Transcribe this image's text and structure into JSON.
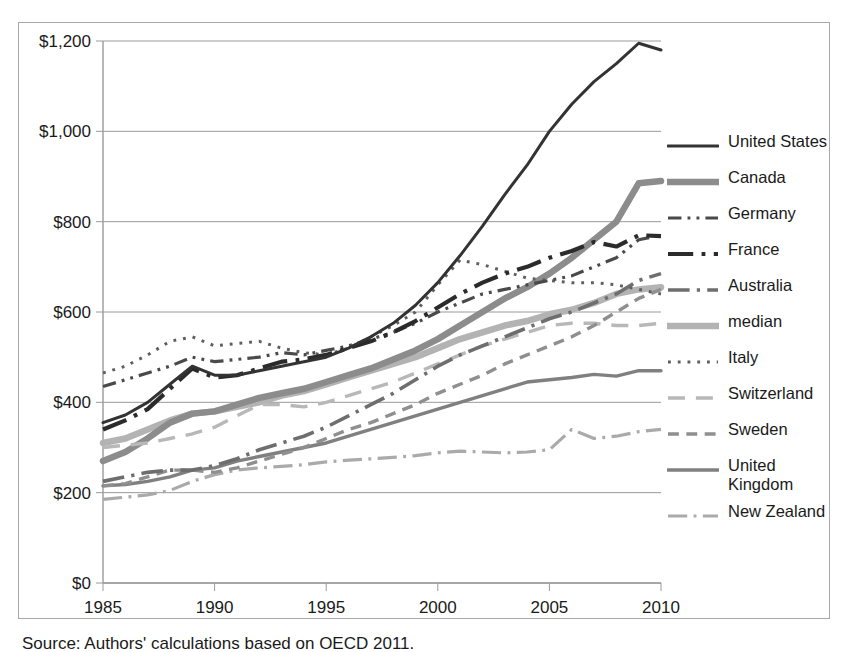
{
  "caption": "Source: Authors' calculations based on OECD 2011.",
  "legend": {
    "title": "",
    "items": [
      {
        "label": "United States",
        "color": "#333333",
        "width": 3.0,
        "dash": "none",
        "name": "legend-item-united-states"
      },
      {
        "label": "Canada",
        "color": "#8c8c8c",
        "width": 6.5,
        "dash": "none",
        "name": "legend-item-canada"
      },
      {
        "label": "Germany",
        "color": "#4a4a4a",
        "width": 3.2,
        "dash": "dashdotdot",
        "name": "legend-item-germany"
      },
      {
        "label": "France",
        "color": "#2b2b2b",
        "width": 4.2,
        "dash": "dashdot",
        "name": "legend-item-france"
      },
      {
        "label": "Australia",
        "color": "#6e6e6e",
        "width": 3.6,
        "dash": "dashdot",
        "name": "legend-item-australia"
      },
      {
        "label": "median",
        "color": "#b3b3b3",
        "width": 6.5,
        "dash": "none",
        "name": "legend-item-median"
      },
      {
        "label": "Italy",
        "color": "#5f5f5f",
        "width": 3.0,
        "dash": "dotted",
        "name": "legend-item-italy"
      },
      {
        "label": "Switzerland",
        "color": "#b8b8b8",
        "width": 3.4,
        "dash": "longdash",
        "name": "legend-item-switzerland"
      },
      {
        "label": "Sweden",
        "color": "#8f8f8f",
        "width": 3.4,
        "dash": "dashed",
        "name": "legend-item-sweden"
      },
      {
        "label": "United\nKingdom",
        "color": "#808080",
        "width": 3.4,
        "dash": "none",
        "name": "legend-item-united-kingdom"
      },
      {
        "label": "New Zealand",
        "color": "#aaaaaa",
        "width": 3.2,
        "dash": "dashdot",
        "name": "legend-item-new-zealand"
      }
    ]
  },
  "chart_data": {
    "type": "line",
    "title": "",
    "xlabel": "",
    "ylabel": "",
    "xlim": [
      1985,
      2010
    ],
    "ylim": [
      0,
      1200
    ],
    "ytick_values": [
      0,
      200,
      400,
      600,
      800,
      1000,
      1200
    ],
    "ytick_labels": [
      "$0",
      "$200",
      "$400",
      "$600",
      "$800",
      "$1,000",
      "$1,200"
    ],
    "xtick_values": [
      1985,
      1990,
      1995,
      2000,
      2005,
      2010
    ],
    "xtick_labels": [
      "1985",
      "1990",
      "1995",
      "2000",
      "2005",
      "2010"
    ],
    "grid": "horizontal",
    "legend_position": "right",
    "x": [
      1985,
      1986,
      1987,
      1988,
      1989,
      1990,
      1991,
      1992,
      1993,
      1994,
      1995,
      1996,
      1997,
      1998,
      1999,
      2000,
      2001,
      2002,
      2003,
      2004,
      2005,
      2006,
      2007,
      2008,
      2009,
      2010
    ],
    "series": [
      {
        "name": "United States",
        "color": "#333333",
        "width": 3.0,
        "dash": "none",
        "values": [
          355,
          372,
          400,
          440,
          480,
          460,
          460,
          470,
          480,
          490,
          500,
          520,
          545,
          575,
          615,
          665,
          725,
          790,
          860,
          925,
          1000,
          1060,
          1110,
          1150,
          1195,
          1180
        ]
      },
      {
        "name": "Canada",
        "color": "#8c8c8c",
        "width": 6.5,
        "dash": "none",
        "values": [
          270,
          290,
          320,
          355,
          375,
          380,
          395,
          410,
          420,
          430,
          445,
          460,
          475,
          495,
          515,
          540,
          570,
          600,
          630,
          655,
          685,
          720,
          760,
          800,
          885,
          890
        ]
      },
      {
        "name": "Germany",
        "color": "#4a4a4a",
        "width": 3.2,
        "dash": "dashdotdot",
        "values": [
          435,
          450,
          465,
          480,
          500,
          490,
          495,
          500,
          510,
          505,
          515,
          525,
          540,
          555,
          575,
          600,
          620,
          640,
          650,
          660,
          670,
          680,
          700,
          720,
          760,
          770
        ]
      },
      {
        "name": "France",
        "color": "#2b2b2b",
        "width": 4.2,
        "dash": "dashdot",
        "values": [
          340,
          360,
          385,
          430,
          475,
          455,
          460,
          475,
          490,
          495,
          505,
          520,
          535,
          555,
          580,
          610,
          640,
          665,
          685,
          700,
          720,
          735,
          755,
          745,
          770,
          768
        ]
      },
      {
        "name": "Australia",
        "color": "#6e6e6e",
        "width": 3.6,
        "dash": "dashdot",
        "values": [
          225,
          235,
          245,
          250,
          250,
          260,
          275,
          295,
          310,
          325,
          345,
          370,
          395,
          420,
          450,
          480,
          505,
          525,
          545,
          565,
          585,
          600,
          620,
          640,
          670,
          685
        ]
      },
      {
        "name": "median",
        "color": "#b3b3b3",
        "width": 6.5,
        "dash": "none",
        "values": [
          310,
          320,
          340,
          360,
          375,
          380,
          390,
          400,
          415,
          425,
          440,
          455,
          470,
          485,
          500,
          520,
          540,
          555,
          570,
          580,
          595,
          605,
          620,
          640,
          650,
          655
        ]
      },
      {
        "name": "Italy",
        "color": "#5f5f5f",
        "width": 3.0,
        "dash": "dotted",
        "values": [
          465,
          480,
          505,
          535,
          545,
          525,
          530,
          535,
          520,
          510,
          505,
          520,
          545,
          570,
          600,
          660,
          715,
          705,
          690,
          675,
          670,
          665,
          665,
          660,
          650,
          640
        ]
      },
      {
        "name": "Switzerland",
        "color": "#b8b8b8",
        "width": 3.4,
        "dash": "longdash",
        "values": [
          300,
          305,
          310,
          320,
          330,
          345,
          370,
          395,
          395,
          390,
          400,
          415,
          430,
          445,
          465,
          485,
          505,
          525,
          540,
          555,
          570,
          575,
          575,
          570,
          570,
          575
        ]
      },
      {
        "name": "Sweden",
        "color": "#8f8f8f",
        "width": 3.4,
        "dash": "dashed",
        "values": [
          215,
          220,
          235,
          250,
          250,
          245,
          255,
          270,
          285,
          300,
          320,
          340,
          355,
          375,
          395,
          420,
          440,
          460,
          485,
          505,
          525,
          545,
          570,
          600,
          630,
          650
        ]
      },
      {
        "name": "United Kingdom",
        "color": "#808080",
        "width": 3.4,
        "dash": "none",
        "values": [
          215,
          218,
          225,
          235,
          250,
          255,
          270,
          280,
          290,
          300,
          310,
          325,
          340,
          355,
          370,
          385,
          400,
          415,
          430,
          445,
          450,
          455,
          462,
          458,
          470,
          470
        ]
      },
      {
        "name": "New Zealand",
        "color": "#aaaaaa",
        "width": 3.2,
        "dash": "dashdot",
        "values": [
          185,
          190,
          195,
          205,
          225,
          240,
          250,
          255,
          258,
          262,
          268,
          272,
          275,
          278,
          282,
          288,
          292,
          290,
          288,
          290,
          295,
          340,
          320,
          325,
          335,
          340
        ]
      }
    ]
  }
}
